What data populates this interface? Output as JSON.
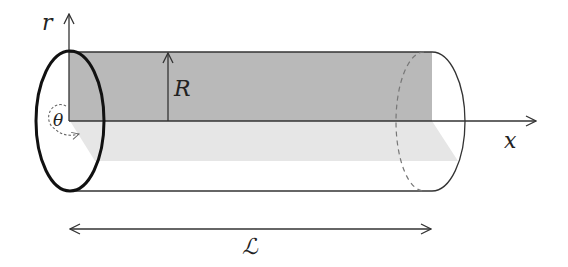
{
  "diagram": {
    "labels": {
      "r_axis": "r",
      "x_axis": "x",
      "radius": "R",
      "angle": "θ",
      "length": "ℒ"
    },
    "colors": {
      "stroke": "#333333",
      "ellipse_stroke": "#111111",
      "dark_shade": "#b9b9b9",
      "light_shade": "#e6e6e6",
      "dashed": "#777777",
      "background": "#ffffff"
    }
  }
}
